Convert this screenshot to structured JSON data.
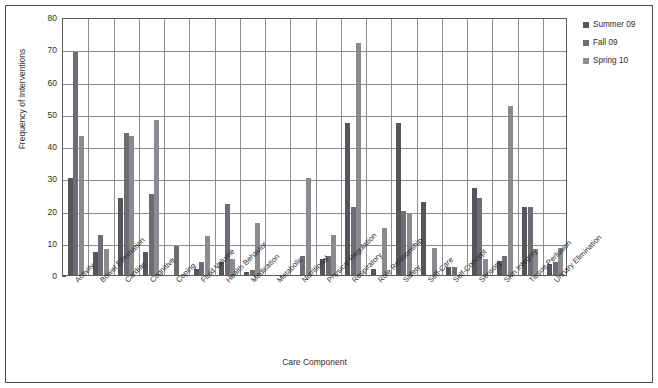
{
  "chart_data": {
    "type": "bar",
    "title": "",
    "xlabel": "Care Component",
    "ylabel": "Frequency of Interventions",
    "ylim": [
      0,
      80
    ],
    "yticks": [
      0,
      10,
      20,
      30,
      40,
      50,
      60,
      70,
      80
    ],
    "grid": true,
    "legend_position": "right",
    "categories": [
      "Activity",
      "Bowel Elimination",
      "Cardiac",
      "Cognitive",
      "Coping",
      "Fluid Volume",
      "Health Behavior",
      "Medication",
      "Metabolic",
      "Nutritional",
      "Physical Regulation",
      "Respiratory",
      "Role Relationship",
      "Safety",
      "Self-Care",
      "Self-Concept",
      "Sensory",
      "Skin Integrity",
      "Tissue Perfusion",
      "Urinary Elimination"
    ],
    "series": [
      {
        "name": "Summer 09",
        "color": "#56565a",
        "values": [
          30,
          7,
          24,
          7,
          0,
          2,
          4,
          1,
          0,
          0,
          5,
          47,
          2,
          47,
          22.5,
          2.5,
          27,
          4.5,
          21,
          3.5
        ]
      },
      {
        "name": "Fall 09",
        "color": "#6c6c71",
        "values": [
          69,
          12.5,
          44,
          25,
          9,
          4,
          22,
          1.5,
          0,
          6,
          6,
          21,
          0,
          20,
          0,
          2.5,
          24,
          6,
          21,
          4
        ]
      },
      {
        "name": "Spring 10",
        "color": "#8a8a8f",
        "values": [
          43,
          8,
          43,
          48,
          0,
          12,
          5,
          16,
          0,
          30,
          12.5,
          72,
          14.5,
          19,
          8.5,
          0,
          5,
          52.5,
          8,
          8.5
        ]
      }
    ]
  },
  "legend": {
    "items": [
      {
        "label": "Summer 09"
      },
      {
        "label": "Fall 09"
      },
      {
        "label": "Spring 10"
      }
    ]
  }
}
